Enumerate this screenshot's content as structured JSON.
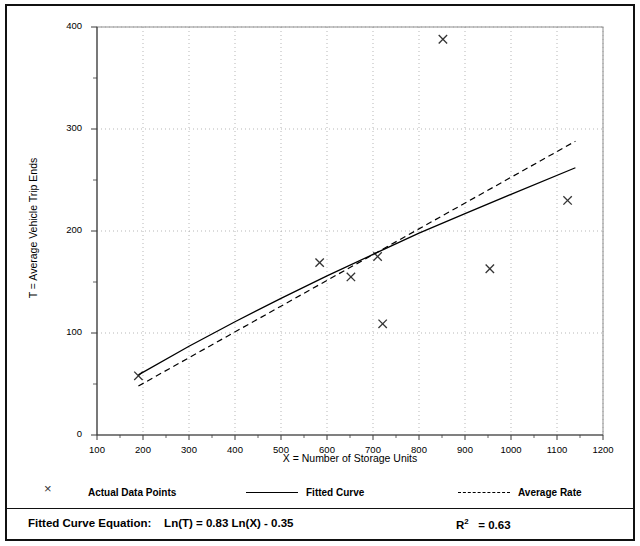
{
  "chart_data": {
    "type": "scatter",
    "title": "",
    "xlabel": "X = Number of Storage Units",
    "ylabel": "T = Average Vehicle Trip Ends",
    "xlim": [
      100,
      1200
    ],
    "ylim": [
      0,
      400
    ],
    "xticks": [
      100,
      200,
      300,
      400,
      500,
      600,
      700,
      800,
      900,
      1000,
      1100,
      1200
    ],
    "yticks": [
      0,
      100,
      200,
      300,
      400
    ],
    "xtick_labels": [
      "100",
      "200",
      "300",
      "400",
      "500",
      "600",
      "700",
      "800",
      "900",
      "1000",
      "1100",
      "1200"
    ],
    "ytick_labels": [
      "0",
      "100",
      "200",
      "300",
      "400"
    ],
    "grid": true,
    "legend_position": "below-axes",
    "series": [
      {
        "name": "Actual Data Points",
        "type": "scatter",
        "marker": "x",
        "color": "#333333",
        "points": [
          {
            "x": 190,
            "y": 58
          },
          {
            "x": 584,
            "y": 169
          },
          {
            "x": 652,
            "y": 155
          },
          {
            "x": 710,
            "y": 175
          },
          {
            "x": 721,
            "y": 109
          },
          {
            "x": 852,
            "y": 388
          },
          {
            "x": 954,
            "y": 163
          },
          {
            "x": 1123,
            "y": 230
          }
        ]
      },
      {
        "name": "Fitted Curve",
        "type": "line",
        "style": "solid",
        "color": "#000000",
        "equation": "Ln(T) = 0.83 Ln(X) - 0.35",
        "points": [
          {
            "x": 190,
            "y": 59
          },
          {
            "x": 300,
            "y": 87
          },
          {
            "x": 400,
            "y": 111
          },
          {
            "x": 500,
            "y": 134
          },
          {
            "x": 600,
            "y": 156
          },
          {
            "x": 700,
            "y": 177
          },
          {
            "x": 800,
            "y": 198
          },
          {
            "x": 900,
            "y": 217
          },
          {
            "x": 1000,
            "y": 236
          },
          {
            "x": 1140,
            "y": 262
          }
        ]
      },
      {
        "name": "Average Rate",
        "type": "line",
        "style": "dashed",
        "color": "#000000",
        "points": [
          {
            "x": 190,
            "y": 48
          },
          {
            "x": 1140,
            "y": 288
          }
        ]
      }
    ],
    "annotations": {
      "equation_label": "Fitted Curve Equation:",
      "equation": "Ln(T) = 0.83 Ln(X) - 0.35",
      "r_squared_label": "R",
      "r_squared_exponent": "2",
      "r_squared_value": "= 0.63"
    }
  },
  "axes": {
    "x_title": "X = Number of Storage Units",
    "y_title": "T = Average Vehicle Trip Ends"
  },
  "legend": {
    "items": [
      {
        "label": "Actual Data Points",
        "swatch": "marker"
      },
      {
        "label": "Fitted Curve",
        "swatch": "solid"
      },
      {
        "label": "Average Rate",
        "swatch": "dashed"
      }
    ]
  },
  "footer": {
    "equation_label": "Fitted Curve Equation:",
    "equation": "Ln(T) = 0.83 Ln(X) - 0.35",
    "r2_prefix": "R",
    "r2_sup": "2",
    "r2_suffix": "= 0.63"
  },
  "colors": {
    "frame": "#111111",
    "grid": "#9a9a9a",
    "axis": "#444444",
    "marker": "#333333",
    "line": "#000000"
  }
}
